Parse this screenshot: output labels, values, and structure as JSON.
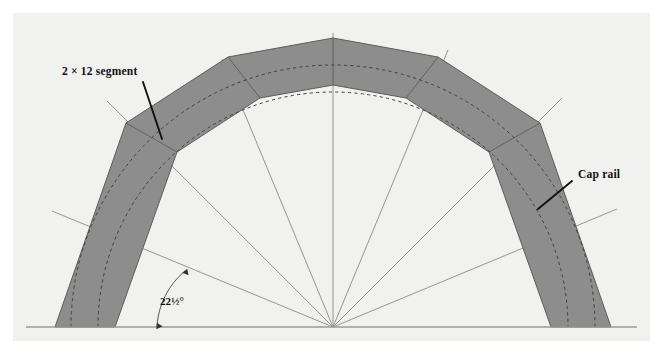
{
  "figure": {
    "kind": "technical-drawing",
    "panel_background": "#f1f1f0",
    "page_background": "#ffffff",
    "band_fill": "#8d8d8d",
    "band_stroke": "#5c5c5c",
    "dashed_curve_color": "#3f3f3f",
    "radial_line_color": "#8a8a8a",
    "baseline_color": "#9a9a9a",
    "leader_color": "#111111",
    "text_color": "#111111"
  },
  "labels": {
    "segment": "2 × 12 segment",
    "cap_rail": "Cap rail",
    "angle": "22½°"
  },
  "geometry": {
    "center_x": 333,
    "baseline_y": 327,
    "apex_x": 333,
    "apex_y": 38,
    "angle_increment_deg": 22.5,
    "segment_count": 8,
    "outer_radius": 278,
    "inner_radius": 218,
    "dashed_radius_outer": 262,
    "dashed_radius_inner": 235
  },
  "annotations": {
    "segment_leader": {
      "x1": 143,
      "y1": 82,
      "x2": 162,
      "y2": 139
    },
    "caprail_leader": {
      "x1": 572,
      "y1": 181,
      "x2": 538,
      "y2": 209
    },
    "angle_arc_label_position": {
      "x": 160,
      "y": 296
    }
  }
}
